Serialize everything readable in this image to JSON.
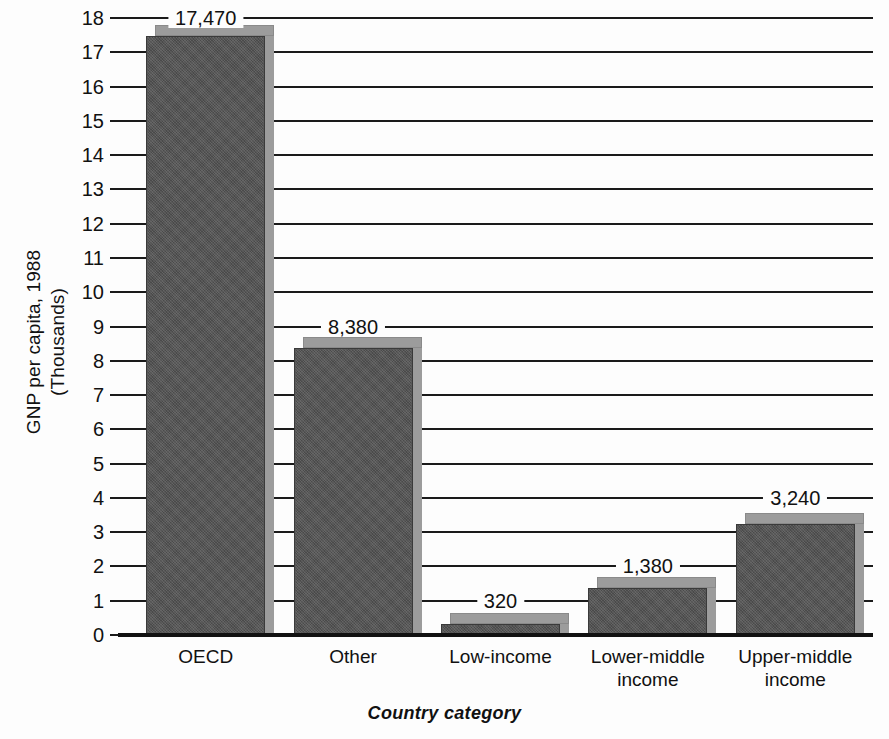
{
  "chart_data": {
    "type": "bar",
    "title": "",
    "subtitle": "",
    "xlabel": "Country category",
    "ylabel": "GNP per capita, 1988 (Thousands)",
    "ylabel_line1": "GNP per capita, 1988",
    "ylabel_line2": "(Thousands)",
    "categories": [
      "OECD",
      "Other",
      "Low-income",
      "Lower-middle income",
      "Upper-middle income"
    ],
    "category_lines": [
      [
        "OECD"
      ],
      [
        "Other"
      ],
      [
        "Low-income"
      ],
      [
        "Lower-middle",
        "income"
      ],
      [
        "Upper-middle",
        "income"
      ]
    ],
    "values": [
      17470,
      8380,
      320,
      1380,
      3240
    ],
    "value_labels": [
      "17,470",
      "8,380",
      "320",
      "1,380",
      "3,240"
    ],
    "units": "thousands of US dollars per capita",
    "ylim": [
      0,
      18
    ],
    "ytick_step": 1,
    "ytick_labels": [
      "18",
      "17",
      "16",
      "15",
      "14",
      "13",
      "12",
      "11",
      "10",
      "9",
      "8",
      "7",
      "6",
      "5",
      "4",
      "3",
      "2",
      "1",
      "0"
    ],
    "ytick_values": [
      18,
      17,
      16,
      15,
      14,
      13,
      12,
      11,
      10,
      9,
      8,
      7,
      6,
      5,
      4,
      3,
      2,
      1,
      0
    ],
    "grid": true,
    "grid_axis": "y",
    "legend": false,
    "legend_position": "none",
    "colors": {
      "bar_face": "#555555",
      "bar_top": "#9c9c9c",
      "bar_border": "#3a3a3a",
      "gridline": "#1a1a1a",
      "axis": "#111111",
      "background": "#fdfdfd",
      "text": "#111111"
    }
  }
}
